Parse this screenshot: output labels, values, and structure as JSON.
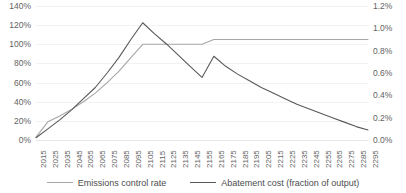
{
  "chart_data": {
    "type": "line",
    "title": "",
    "xlabel": "",
    "ylabel": "",
    "grid": true,
    "legend_position": "bottom",
    "x": [
      2015,
      2025,
      2035,
      2045,
      2055,
      2065,
      2075,
      2085,
      2095,
      2105,
      2115,
      2125,
      2135,
      2145,
      2155,
      2165,
      2175,
      2185,
      2195,
      2205,
      2215,
      2225,
      2235,
      2245,
      2255,
      2265,
      2275,
      2285,
      2295
    ],
    "xtick_labels": [
      "2015",
      "2025",
      "2035",
      "2045",
      "2055",
      "2065",
      "2075",
      "2085",
      "2095",
      "2105",
      "2115",
      "2125",
      "2135",
      "2145",
      "2155",
      "2165",
      "2175",
      "2185",
      "2195",
      "2205",
      "2215",
      "2225",
      "2235",
      "2245",
      "2255",
      "2265",
      "2275",
      "2285",
      "2295"
    ],
    "axes": [
      {
        "id": "left",
        "label": "",
        "ylim": [
          0,
          140
        ],
        "unit": "%",
        "tick_labels": [
          "140%",
          "120%",
          "100%",
          "80%",
          "60%",
          "40%",
          "20%",
          "0%"
        ],
        "tick_values": [
          140,
          120,
          100,
          80,
          60,
          40,
          20,
          0
        ]
      },
      {
        "id": "right",
        "label": "",
        "ylim": [
          0.0,
          1.2
        ],
        "unit": "%",
        "tick_labels": [
          "1.2%",
          "1.0%",
          "0.8%",
          "0.6%",
          "0.4%",
          "0.2%",
          "0.0%"
        ],
        "tick_values": [
          1.2,
          1.0,
          0.8,
          0.6,
          0.4,
          0.2,
          0.0
        ]
      }
    ],
    "series": [
      {
        "name": "Emissions control rate",
        "axis": "left",
        "color": "#a6a6a6",
        "values": [
          3,
          19,
          25,
          32,
          40,
          49,
          60,
          72,
          86,
          100,
          100,
          100,
          100,
          100,
          100,
          105,
          105,
          105,
          105,
          105,
          105,
          105,
          105,
          105,
          105,
          105,
          105,
          105,
          105
        ]
      },
      {
        "name": "Abatement cost (fraction of output)",
        "axis": "right",
        "color": "#595959",
        "values": [
          0.02,
          0.1,
          0.18,
          0.27,
          0.37,
          0.47,
          0.6,
          0.74,
          0.9,
          1.05,
          0.95,
          0.86,
          0.76,
          0.66,
          0.56,
          0.75,
          0.66,
          0.59,
          0.53,
          0.47,
          0.42,
          0.37,
          0.32,
          0.28,
          0.24,
          0.2,
          0.16,
          0.12,
          0.09
        ]
      }
    ]
  },
  "legend": {
    "items": [
      {
        "label": "Emissions control rate"
      },
      {
        "label": "Abatement cost (fraction of output)"
      }
    ]
  }
}
